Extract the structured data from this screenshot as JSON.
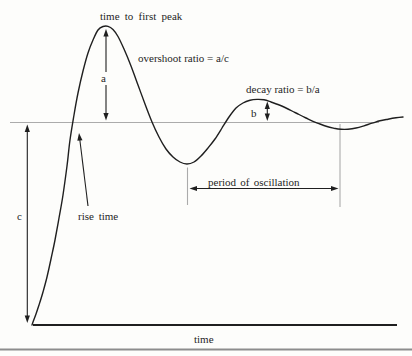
{
  "diagram": {
    "type": "annotated-step-response-curve",
    "labels": {
      "time_to_first_peak": "time to first peak",
      "overshoot_ratio": "overshoot ratio = a/c",
      "decay_ratio": "decay ratio = b/a",
      "a": "a",
      "b": "b",
      "c": "c",
      "rise_time": "rise time",
      "period_of_oscillation": "period of oscillation",
      "time_axis": "time"
    },
    "colors": {
      "ink": "#1f1f1f",
      "guide_gray": "#ababab",
      "rule_gray": "#8d8d8d",
      "background": "#fdfdfb"
    },
    "geometry": {
      "canvas": {
        "width": 412,
        "height": 356
      },
      "steady_state_line": {
        "x1": 10,
        "y1": 122.5,
        "x2": 379,
        "y2": 122.5
      },
      "time_axis_line": {
        "x1": 33,
        "y1": 325,
        "x2": 397,
        "y2": 325
      },
      "bottom_rule": {
        "x1": 0,
        "y1": 349.5,
        "x2": 412,
        "y2": 349.5
      },
      "trough_ticks": [
        {
          "x1": 187.5,
          "y1": 167.5,
          "x2": 187.5,
          "y2": 205
        },
        {
          "x1": 340,
          "y1": 124,
          "x2": 340,
          "y2": 207
        }
      ],
      "arrows": [
        {
          "name": "overshoot-a-arrow",
          "x1": 106,
          "y1": 29,
          "x2": 106,
          "y2": 120.5,
          "heads": "both"
        },
        {
          "name": "decay-b-arrow",
          "x1": 267.3,
          "y1": 101.5,
          "x2": 267.3,
          "y2": 121,
          "heads": "both"
        },
        {
          "name": "step-size-c-arrow",
          "x1": 27.3,
          "y1": 124.5,
          "x2": 27.3,
          "y2": 323,
          "heads": "both"
        },
        {
          "name": "period-arrow",
          "x1": 189.5,
          "y1": 188.5,
          "x2": 338.5,
          "y2": 188.5,
          "heads": "both"
        },
        {
          "name": "rise-time-pointer",
          "x1": 88,
          "y1": 206,
          "x2": 79,
          "y2": 133,
          "heads": "end"
        }
      ],
      "curve_points": [
        [
          32,
          325
        ],
        [
          33,
          322
        ],
        [
          36,
          314
        ],
        [
          39,
          305
        ],
        [
          43,
          292
        ],
        [
          47,
          277
        ],
        [
          51,
          259
        ],
        [
          55,
          240
        ],
        [
          59,
          218
        ],
        [
          63,
          195
        ],
        [
          67,
          166
        ],
        [
          70,
          140
        ],
        [
          74,
          115
        ],
        [
          78,
          93
        ],
        [
          83,
          71
        ],
        [
          88,
          53
        ],
        [
          93,
          40
        ],
        [
          98,
          30
        ],
        [
          103,
          26.5
        ],
        [
          108,
          26.3
        ],
        [
          113,
          29.5
        ],
        [
          118,
          36.5
        ],
        [
          124,
          49
        ],
        [
          131,
          66
        ],
        [
          138,
          85
        ],
        [
          145,
          104
        ],
        [
          152,
          122
        ],
        [
          159,
          137
        ],
        [
          166,
          149
        ],
        [
          173,
          157
        ],
        [
          180,
          162
        ],
        [
          187,
          164
        ],
        [
          194,
          162
        ],
        [
          201,
          156
        ],
        [
          208,
          148
        ],
        [
          215,
          139
        ],
        [
          222,
          128
        ],
        [
          229,
          117
        ],
        [
          236,
          108
        ],
        [
          243,
          103
        ],
        [
          250,
          100.3
        ],
        [
          257,
          99.4
        ],
        [
          264,
          99.8
        ],
        [
          271,
          102
        ],
        [
          278,
          104.5
        ],
        [
          285,
          107.5
        ],
        [
          292,
          111
        ],
        [
          299,
          114.5
        ],
        [
          306,
          118
        ],
        [
          313,
          121.3
        ],
        [
          320,
          124
        ],
        [
          327,
          126.5
        ],
        [
          334,
          128.2
        ],
        [
          341,
          129.2
        ],
        [
          348,
          129.2
        ],
        [
          356,
          128
        ],
        [
          364,
          125.8
        ],
        [
          372,
          123.2
        ],
        [
          380,
          120.8
        ],
        [
          388,
          119.2
        ],
        [
          396,
          117.8
        ],
        [
          403,
          117
        ]
      ]
    }
  }
}
